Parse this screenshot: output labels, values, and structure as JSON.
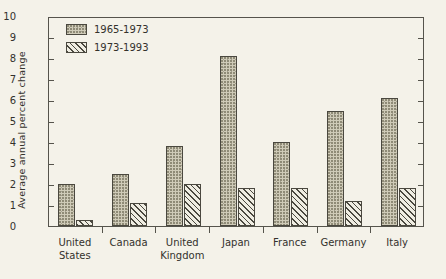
{
  "chart_data": {
    "type": "bar",
    "title": "",
    "xlabel": "",
    "ylabel": "Average annual percent change",
    "ylim": [
      0,
      10
    ],
    "yticks": [
      "0",
      "1",
      "2",
      "3",
      "4",
      "5",
      "6",
      "7",
      "8",
      "9",
      "10"
    ],
    "grid": false,
    "legend_position": "top-left",
    "categories": [
      "United States",
      "Canada",
      "United Kingdom",
      "Japan",
      "France",
      "Germany",
      "Italy"
    ],
    "category_lines": [
      [
        "United",
        "States"
      ],
      [
        "Canada"
      ],
      [
        "United",
        "Kingdom"
      ],
      [
        "Japan"
      ],
      [
        "France"
      ],
      [
        "Germany"
      ],
      [
        "Italy"
      ]
    ],
    "series": [
      {
        "name": "1965-1973",
        "fill": "stipple",
        "color": "#cfcbb8",
        "values": [
          2.0,
          2.5,
          3.8,
          8.1,
          4.0,
          5.5,
          6.1
        ]
      },
      {
        "name": "1973-1993",
        "fill": "diagonal-hatch",
        "color": "#efede2",
        "values": [
          0.3,
          1.1,
          2.0,
          1.8,
          1.8,
          1.2,
          1.8
        ]
      }
    ]
  },
  "colors": {
    "background": "#f4f2e9",
    "axis": "#55544c",
    "bar_outline": "#4a483f",
    "text": "#33312c"
  }
}
